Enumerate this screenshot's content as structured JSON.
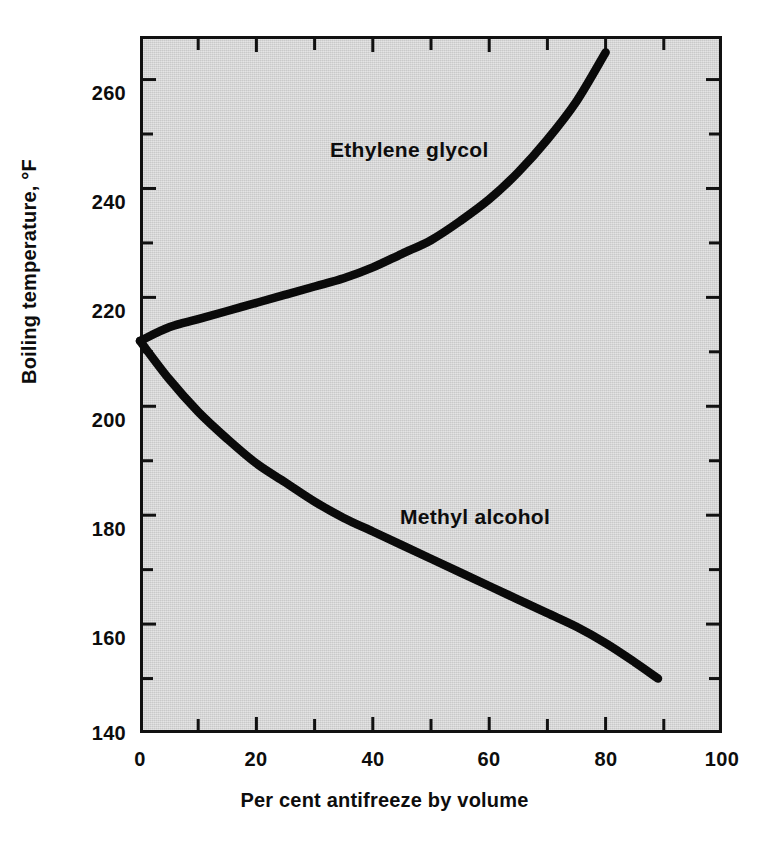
{
  "chart_data": {
    "type": "line",
    "title": "",
    "xlabel": "Per cent antifreeze by volume",
    "ylabel": "Boiling temperature, °F",
    "xlim": [
      0,
      100
    ],
    "ylim": [
      140,
      268
    ],
    "grid": false,
    "legend_position": "inline-annotations",
    "background_color": "#d5d5d5",
    "line_color": "#0a0a0a",
    "xticks": [
      0,
      10,
      20,
      30,
      40,
      50,
      60,
      70,
      80,
      90,
      100
    ],
    "xtick_labels": [
      "0",
      "",
      "20",
      "",
      "40",
      "",
      "60",
      "",
      "80",
      "",
      "100"
    ],
    "yticks": [
      140,
      150,
      160,
      170,
      180,
      190,
      200,
      210,
      220,
      230,
      240,
      250,
      260
    ],
    "ytick_labels": [
      "140",
      "",
      "160",
      "",
      "180",
      "",
      "200",
      "",
      "220",
      "",
      "240",
      "",
      "260"
    ],
    "series": [
      {
        "name": "Ethylene glycol",
        "annotation": "Ethylene glycol",
        "x": [
          0,
          5,
          10,
          15,
          20,
          25,
          30,
          35,
          40,
          45,
          50,
          55,
          60,
          65,
          70,
          75,
          80
        ],
        "values": [
          212,
          214.5,
          216,
          217.5,
          219,
          220.5,
          222,
          223.5,
          225.5,
          228,
          230.5,
          234,
          238,
          243,
          249,
          256,
          265
        ]
      },
      {
        "name": "Methyl alcohol",
        "annotation": "Methyl alcohol",
        "x": [
          0,
          5,
          10,
          15,
          20,
          25,
          30,
          35,
          40,
          45,
          50,
          55,
          60,
          65,
          70,
          75,
          80,
          85,
          89
        ],
        "values": [
          212,
          205,
          199,
          194,
          189.5,
          186,
          182.5,
          179.5,
          177,
          174.5,
          172,
          169.5,
          167,
          164.5,
          162,
          159.5,
          156.5,
          153,
          150
        ]
      }
    ]
  },
  "axes": {
    "ytick_labels_visible": [
      "260",
      "240",
      "220",
      "200",
      "180",
      "160",
      "140"
    ],
    "xtick_labels_visible": [
      "0",
      "20",
      "40",
      "60",
      "80",
      "100"
    ]
  },
  "labels": {
    "ytick_260": "260",
    "ytick_240": "240",
    "ytick_220": "220",
    "ytick_200": "200",
    "ytick_180": "180",
    "ytick_160": "160",
    "ytick_140": "140",
    "xtick_0": "0",
    "xtick_20": "20",
    "xtick_40": "40",
    "xtick_60": "60",
    "xtick_80": "80",
    "xtick_100": "100",
    "xaxis_title": "Per cent antifreeze by volume",
    "yaxis_title": "Boiling temperature, °F",
    "annot_ethylene": "Ethylene glycol",
    "annot_methyl": "Methyl alcohol"
  }
}
